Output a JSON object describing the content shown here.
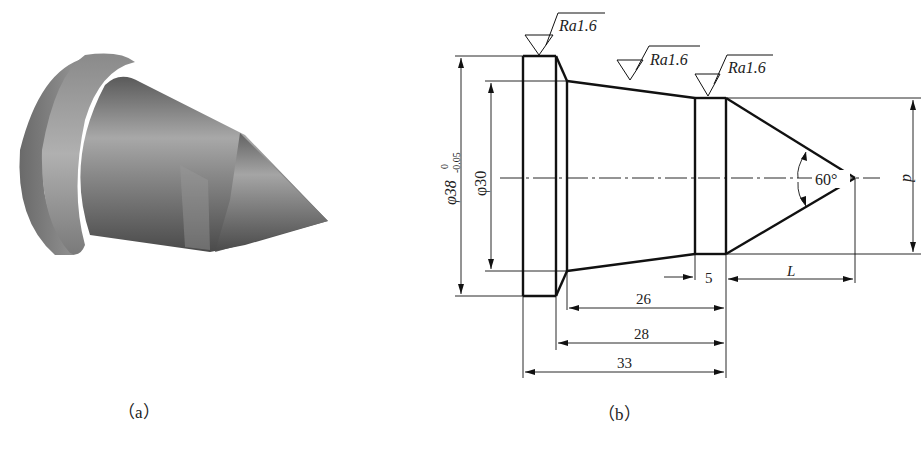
{
  "figure": {
    "panel_a": {
      "caption": "（a）",
      "description": "3D shaded model of conical center (tip) part"
    },
    "panel_b": {
      "caption": "（b）",
      "description": "Dimensioned engineering drawing of the part",
      "surface_finish": [
        "Ra1.6",
        "Ra1.6",
        "Ra1.6"
      ],
      "dimensions": {
        "flange_diameter": "φ38",
        "flange_tol_upper": "0",
        "flange_tol_lower": "-0.05",
        "neck_diameter": "φ30",
        "tip_angle": "60°",
        "band_width": "5",
        "len_26": "26",
        "len_28": "28",
        "len_33": "33",
        "cone_length": "L",
        "band_diameter": "d"
      }
    }
  }
}
